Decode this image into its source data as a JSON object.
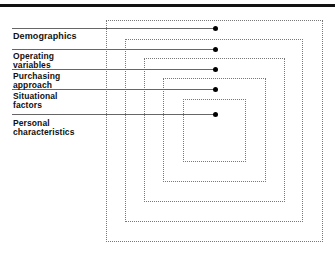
{
  "diagram": {
    "type": "nested-segmentation",
    "layers": [
      {
        "label": "Demographics",
        "line_y": 28,
        "label_top": 18,
        "box": {
          "left": 106,
          "top": 20,
          "right": 323,
          "bottom": 242
        }
      },
      {
        "label": "Operating\nvariables",
        "line_y": 49,
        "label_top": 33,
        "box": {
          "left": 125,
          "top": 39,
          "right": 303,
          "bottom": 222
        }
      },
      {
        "label": "Purchasing\napproach",
        "line_y": 69,
        "label_top": 52,
        "box": {
          "left": 144,
          "top": 58,
          "right": 285,
          "bottom": 202
        }
      },
      {
        "label": "Situational\nfactors",
        "line_y": 89,
        "label_top": 73,
        "box": {
          "left": 163,
          "top": 78,
          "right": 266,
          "bottom": 182
        }
      },
      {
        "label": "Personal\ncharacteristics",
        "line_y": 114,
        "label_top": 119,
        "box": {
          "left": 183,
          "top": 99,
          "right": 246,
          "bottom": 162
        }
      }
    ],
    "dot_x": 215,
    "colors": {
      "line": "#666666",
      "dot": "#000000",
      "box_border": "#777777",
      "top_bar": "#111111"
    }
  }
}
